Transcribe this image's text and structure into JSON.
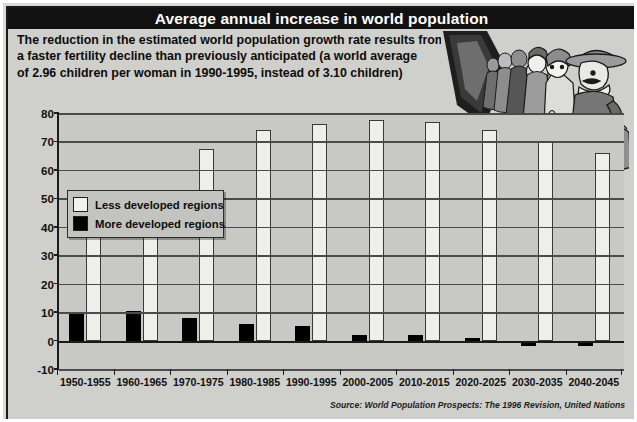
{
  "title": "Average annual increase in world population",
  "intro_lines": [
    "The reduction in the estimated world population growth rate results from",
    "a faster fertility decline than previously anticipated (a world average",
    "of 2.96 children per woman in 1990-1995, instead of 3.10 children)"
  ],
  "legend": {
    "items": [
      {
        "label": "Less developed regions",
        "color": "#f2f2ee",
        "key": "light"
      },
      {
        "label": "More developed regions",
        "color": "#000000",
        "key": "dark"
      }
    ]
  },
  "source": "Source: World Population Prospects: The 1996 Revision, United Nations",
  "illustration": {
    "name": "queue-of-people-illustration",
    "description": "Line of people standing in a queue receding into the distance"
  },
  "colors": {
    "title_bar": "#111111",
    "panel": "#cfcfcb",
    "plot": "#c8c8c4",
    "gridline": "#4b4b4b",
    "axis": "#1b1b1b",
    "less_developed": "#eeeeea",
    "more_developed": "#000000"
  },
  "chart_data": {
    "type": "bar",
    "title": "Average annual increase in world population",
    "xlabel": "",
    "ylabel": "",
    "ylim": [
      -10,
      80
    ],
    "yticks": [
      -10,
      0,
      10,
      20,
      30,
      40,
      50,
      60,
      70,
      80
    ],
    "grid": true,
    "legend_position": "top-left inside plot",
    "categories": [
      "1950-1955",
      "1960-1965",
      "1970-1975",
      "1980-1985",
      "1990-1995",
      "2000-2005",
      "2010-2015",
      "2020-2025",
      "2030-2035",
      "2040-2045"
    ],
    "series": [
      {
        "name": "More developed regions",
        "color": "#000000",
        "values": [
          10,
          10.5,
          8,
          6,
          5,
          2,
          2,
          1,
          -2,
          -2
        ]
      },
      {
        "name": "Less developed regions",
        "color": "#eeeeea",
        "values": [
          37,
          53,
          67.5,
          74,
          76,
          77.5,
          77,
          74,
          70,
          66
        ]
      }
    ]
  }
}
